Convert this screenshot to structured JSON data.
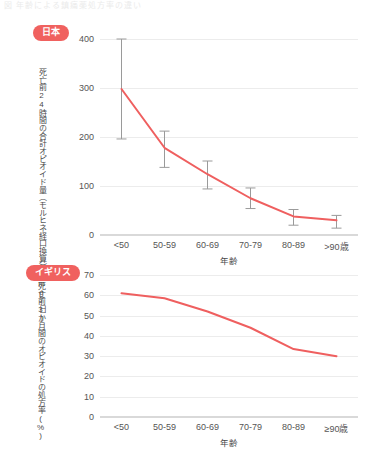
{
  "page": {
    "header_caption": "図 年齢による鎮痛薬処方率の違い",
    "accent_color": "#f0615f",
    "grid_color": "#ececec",
    "errorbar_color": "#9a9a9a"
  },
  "charts": [
    {
      "badge": "日本",
      "badge_name": "badge-japan",
      "ylabel": "死亡前24時間の合計オピオイド量（モルヒネ経口換算）(mg/日)",
      "xlabel": "年齢",
      "yticks": [
        "400",
        "300",
        "200",
        "100",
        "0"
      ],
      "xticks": [
        "<50",
        "50-59",
        "60-69",
        "70-79",
        "80-89",
        ">90歳"
      ]
    },
    {
      "badge": "イギリス",
      "badge_name": "badge-uk",
      "ylabel": "死亡前3か月間のオピオイドの処方率(%)",
      "xlabel": "年齢",
      "yticks": [
        "70",
        "60",
        "50",
        "40",
        "30",
        "20",
        "10",
        "0"
      ],
      "xticks": [
        "<50",
        "50-59",
        "60-69",
        "70-79",
        "80-89",
        "≥90歳"
      ]
    }
  ],
  "chart_data": [
    {
      "type": "line",
      "title": "日本",
      "xlabel": "年齢",
      "ylabel": "死亡前24時間の合計オピオイド量（モルヒネ経口換算）(mg/日)",
      "categories": [
        "<50",
        "50-59",
        "60-69",
        "70-79",
        "80-89",
        ">90歳"
      ],
      "values": [
        298,
        178,
        124,
        75,
        38,
        30
      ],
      "error_low": [
        196,
        138,
        94,
        54,
        20,
        14
      ],
      "error_high": [
        400,
        212,
        151,
        96,
        52,
        40
      ],
      "ylim": [
        0,
        400
      ],
      "yticks": [
        0,
        100,
        200,
        300,
        400
      ],
      "grid": true,
      "legend": "none",
      "series_color": "#ef5f5f",
      "errorbar": true
    },
    {
      "type": "line",
      "title": "イギリス",
      "xlabel": "年齢",
      "ylabel": "死亡前3か月間のオピオイドの処方率(%)",
      "categories": [
        "<50",
        "50-59",
        "60-69",
        "70-79",
        "80-89",
        "≥90歳"
      ],
      "values": [
        61,
        58.5,
        52,
        44,
        33.5,
        30
      ],
      "ylim": [
        0,
        70
      ],
      "yticks": [
        0,
        10,
        20,
        30,
        40,
        50,
        60,
        70
      ],
      "grid": true,
      "legend": "none",
      "series_color": "#ef5f5f",
      "errorbar": false
    }
  ]
}
